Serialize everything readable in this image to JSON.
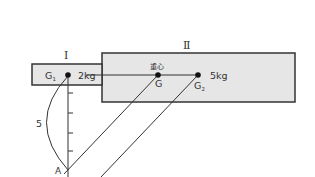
{
  "diagram": {
    "block_I": {
      "label": "Ⅰ",
      "mass": "2kg",
      "center_label": "G",
      "center_sub": "1"
    },
    "block_II": {
      "label": "Ⅱ",
      "mass": "5kg",
      "center_label": "G",
      "center_sub": "2"
    },
    "combined_center": {
      "label": "G",
      "caption": "重心"
    },
    "pivot": {
      "label": "A"
    },
    "length": {
      "label": "5"
    },
    "colors": {
      "block_fill": "#e6e6e6",
      "stroke": "#333333"
    }
  }
}
